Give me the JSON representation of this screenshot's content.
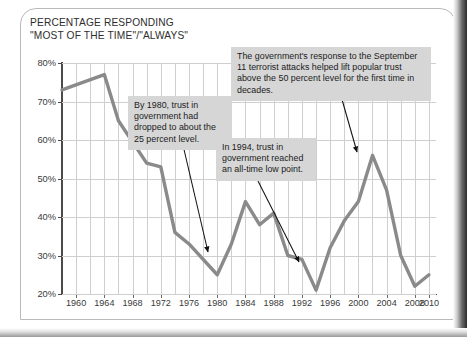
{
  "figure": {
    "title": "PERCENTAGE RESPONDING\n\"MOST OF THE TIME\"/\"ALWAYS\""
  },
  "callouts": {
    "c1980": "By 1980, trust in government had dropped to about the 25 percent level.",
    "c1994": "In 1994, trust in government reached an all-time low point.",
    "c2001": "The government's response to the September 11 terrorist attacks helped lift popular trust above the 50 percent level for the first time in decades."
  },
  "chart_data": {
    "type": "line",
    "title": "PERCENTAGE RESPONDING \"MOST OF THE TIME\"/\"ALWAYS\"",
    "xlabel": "",
    "ylabel": "",
    "xlim": [
      1958,
      2011
    ],
    "ylim": [
      20,
      80
    ],
    "grid": true,
    "legend": false,
    "y_tick_labels": [
      "20%",
      "30%",
      "40%",
      "50%",
      "60%",
      "70%",
      "80%"
    ],
    "y_ticks": [
      20,
      30,
      40,
      50,
      60,
      70,
      80
    ],
    "x_tick_labels": [
      "1960",
      "1964",
      "1968",
      "1972",
      "1976",
      "1980",
      "1984",
      "1988",
      "1992",
      "1996",
      "2000",
      "2004",
      "2008",
      "2010"
    ],
    "x_ticks": [
      1960,
      1964,
      1968,
      1972,
      1976,
      1980,
      1984,
      1988,
      1992,
      1996,
      2000,
      2004,
      2008,
      2010
    ],
    "gridline_years": [
      1960,
      1962,
      1964,
      1966,
      1968,
      1970,
      1972,
      1974,
      1976,
      1978,
      1980,
      1982,
      1984,
      1986,
      1988,
      1990,
      1992,
      1994,
      1996,
      1998,
      2000,
      2002,
      2004,
      2006,
      2008,
      2010
    ],
    "series": [
      {
        "name": "Trust in government",
        "color": "#8a8a8a",
        "x": [
          1958,
          1964,
          1966,
          1970,
          1972,
          1974,
          1976,
          1980,
          1982,
          1984,
          1986,
          1988,
          1990,
          1992,
          1994,
          1996,
          1998,
          2000,
          2002,
          2004,
          2006,
          2008,
          2010
        ],
        "values": [
          73,
          77,
          65,
          54,
          53,
          36,
          33,
          25,
          33,
          44,
          38,
          41,
          30,
          29,
          21,
          32,
          39,
          44,
          56,
          47,
          30,
          22,
          25
        ]
      }
    ],
    "annotations": [
      {
        "text": "By 1980, trust in government had dropped to about the 25 percent level.",
        "points_to_x": 1980,
        "points_to_y": 25
      },
      {
        "text": "In 1994, trust in government reached an all-time low point.",
        "points_to_x": 1994,
        "points_to_y": 21
      },
      {
        "text": "The government's response to the September 11 terrorist attacks helped lift popular trust above the 50 percent level for the first time in decades.",
        "points_to_x": 2002,
        "points_to_y": 56
      }
    ]
  }
}
